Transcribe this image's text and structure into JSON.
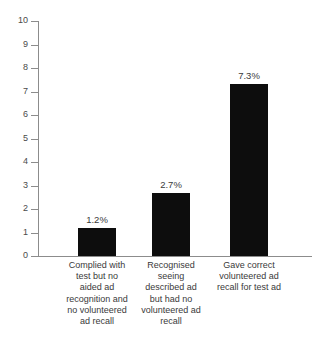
{
  "chart_data": {
    "type": "bar",
    "title": "",
    "subtitle": "",
    "xlabel": "",
    "ylabel": "",
    "ylim": [
      0,
      10
    ],
    "grid": false,
    "legend": false,
    "orientation": "vertical",
    "bar_color": "#0d0d0d",
    "axis_color": "#8c8c8c",
    "categories": [
      "Complied with test but no aided ad recognition and no volunteered ad recall",
      "Recognised seeing described ad but had no volunteered ad recall",
      "Gave correct volunteered ad recall for test ad"
    ],
    "category_lines": [
      [
        "Complied with",
        "test but no",
        "aided ad",
        "recognition and",
        "no volunteered",
        "ad recall"
      ],
      [
        "Recognised",
        "seeing",
        "described ad",
        "but had no",
        "volunteered ad",
        "recall"
      ],
      [
        "Gave correct",
        "volunteered ad",
        "recall for test ad"
      ]
    ],
    "values": [
      1.2,
      2.7,
      7.3
    ],
    "data_labels": [
      "1.2%",
      "2.7%",
      "7.3%"
    ],
    "y_ticks": [
      0,
      1,
      2,
      3,
      4,
      5,
      6,
      7,
      8,
      9,
      10
    ],
    "y_tick_labels": [
      "0",
      "1",
      "2",
      "3",
      "4",
      "5",
      "6",
      "7",
      "8",
      "9",
      "10"
    ]
  }
}
